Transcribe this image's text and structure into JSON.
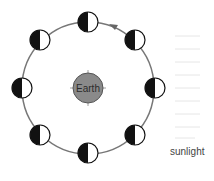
{
  "diagram": {
    "center": {
      "label": "Earth",
      "color": "#8a8a8a"
    },
    "orbit": {
      "cx": 88,
      "cy": 88,
      "r": 66,
      "color": "#777777",
      "direction": "counterclockwise"
    },
    "moons": [
      {
        "id": "top",
        "cx": 88,
        "cy": 22
      },
      {
        "id": "top-right",
        "cx": 135,
        "cy": 40
      },
      {
        "id": "right",
        "cx": 155,
        "cy": 88
      },
      {
        "id": "bottom-right",
        "cx": 135,
        "cy": 135
      },
      {
        "id": "bottom",
        "cx": 88,
        "cy": 153
      },
      {
        "id": "bottom-left",
        "cx": 40,
        "cy": 135
      },
      {
        "id": "left",
        "cx": 22,
        "cy": 88
      },
      {
        "id": "top-left",
        "cx": 40,
        "cy": 40
      }
    ],
    "sunlight": {
      "label": "sunlight",
      "direction": "from right"
    }
  }
}
